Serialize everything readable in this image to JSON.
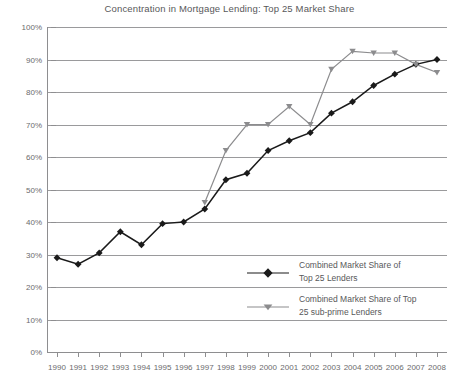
{
  "chart_data": {
    "type": "line",
    "title": "Concentration in Mortgage Lending: Top 25 Market Share",
    "xlabel": "",
    "ylabel": "",
    "x": [
      1990,
      1991,
      1992,
      1993,
      1994,
      1995,
      1996,
      1997,
      1998,
      1999,
      2000,
      2001,
      2002,
      2003,
      2004,
      2005,
      2006,
      2007,
      2008
    ],
    "categories": [
      "1990",
      "1991",
      "1992",
      "1993",
      "1994",
      "1995",
      "1996",
      "1997",
      "1998",
      "1999",
      "2000",
      "2001",
      "2002",
      "2003",
      "2004",
      "2005",
      "2006",
      "2007",
      "2008"
    ],
    "ylim": [
      0,
      100
    ],
    "yticks": [
      0,
      10,
      20,
      30,
      40,
      50,
      60,
      70,
      80,
      90,
      100
    ],
    "ytick_labels": [
      "0%",
      "10%",
      "20%",
      "30%",
      "40%",
      "50%",
      "60%",
      "70%",
      "80%",
      "90%",
      "100%"
    ],
    "grid": true,
    "legend_position": "bottom-right",
    "series": [
      {
        "name": "Combined Market Share of Top 25 Lenders",
        "color": "#1a1a1a",
        "marker": "diamond",
        "values": [
          29,
          27,
          30.5,
          37,
          33,
          39.5,
          40,
          44,
          53,
          55,
          62,
          65,
          67.5,
          73.5,
          77,
          82,
          85.5,
          88.5,
          90
        ]
      },
      {
        "name": "Combined Market Share of Top 25 sub-prime Lenders",
        "color": "#8c8c8e",
        "marker": "triangle-down",
        "values": [
          null,
          null,
          null,
          null,
          null,
          null,
          null,
          46,
          62,
          70,
          70,
          75.5,
          70,
          87,
          92.5,
          92,
          92,
          88.5,
          86
        ]
      }
    ]
  },
  "legend": {
    "entries": [
      {
        "line1": "Combined Market Share of",
        "line2": "Top 25 Lenders",
        "color": "#1a1a1a"
      },
      {
        "line1": "Combined Market Share of Top",
        "line2": "25 sub-prime Lenders",
        "color": "#8c8c8e"
      }
    ]
  },
  "colors": {
    "series_primary": "#1a1a1a",
    "series_secondary": "#8c8c8e",
    "gridline": "#9a9a9c",
    "axis": "#8e8e90",
    "text": "#58585a"
  }
}
